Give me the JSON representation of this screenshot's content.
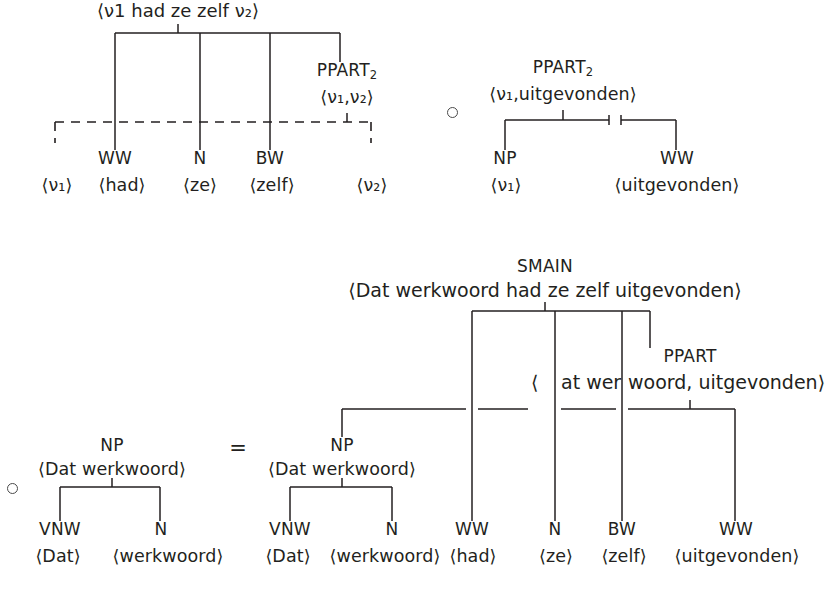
{
  "figure": {
    "ink_color": "#231f20",
    "operators": {
      "compose": "∘",
      "equals": "="
    }
  },
  "top_left_tree": {
    "root_yield": "⟨ν1 had ze zelf ν₂⟩",
    "internal_node": {
      "category": "PPART",
      "subscript": "2",
      "yield": "⟨ν₁,ν₂⟩"
    },
    "leaves": [
      {
        "category": "",
        "yield": "⟨ν₁⟩",
        "placeholder": true
      },
      {
        "category": "WW",
        "yield": "⟨had⟩",
        "placeholder": false
      },
      {
        "category": "N",
        "yield": "⟨ze⟩",
        "placeholder": false
      },
      {
        "category": "BW",
        "yield": "⟨zelf⟩",
        "placeholder": false
      },
      {
        "category": "",
        "yield": "⟨ν₂⟩",
        "placeholder": true
      }
    ]
  },
  "top_right_tree": {
    "root_category": "PPART",
    "root_subscript": "2",
    "root_yield": "⟨ν₁,uitgevonden⟩",
    "leaves": [
      {
        "category": "NP",
        "yield": "⟨ν₁⟩"
      },
      {
        "category": "WW",
        "yield": "⟨uitgevonden⟩"
      }
    ]
  },
  "bottom_left_tree": {
    "root_category": "NP",
    "root_yield": "⟨Dat werkwoord⟩",
    "leaves": [
      {
        "category": "VNW",
        "yield": "⟨Dat⟩"
      },
      {
        "category": "N",
        "yield": "⟨werkwoord⟩"
      }
    ]
  },
  "result_tree": {
    "root_category": "SMAIN",
    "root_yield": "⟨Dat werkwoord had ze zelf uitgevonden⟩",
    "np_node": {
      "category": "NP",
      "yield": "⟨Dat werkwoord⟩"
    },
    "ppart_node": {
      "category": "PPART",
      "yield": "⟨Dat werkwoord, uitgevonden⟩",
      "yield_fragment_open": "⟨",
      "yield_fragment_mid": "at wer",
      "yield_fragment_rest": "woord, uitgevonden⟩"
    },
    "leaves": [
      {
        "category": "VNW",
        "yield": "⟨Dat⟩"
      },
      {
        "category": "N",
        "yield": "⟨werkwoord⟩"
      },
      {
        "category": "WW",
        "yield": "⟨had⟩"
      },
      {
        "category": "N",
        "yield": "⟨ze⟩"
      },
      {
        "category": "BW",
        "yield": "⟨zelf⟩"
      },
      {
        "category": "WW",
        "yield": "⟨uitgevonden⟩"
      }
    ]
  }
}
